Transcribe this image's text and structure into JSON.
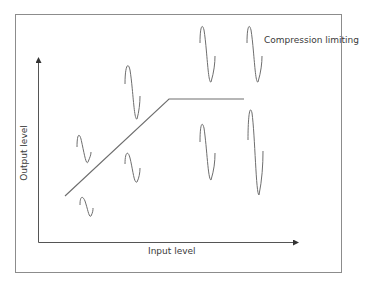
{
  "diagram": {
    "title_annotation": "Compression limiting",
    "x_axis_label": "Input level",
    "y_axis_label": "Output level",
    "colors": {
      "frame": "#8c8c8c",
      "axis": "#555555",
      "curve": "#6e6e6e",
      "wave": "#6e6e6e",
      "text": "#3a3a3a"
    },
    "transfer_curve": {
      "points": [
        [
          65,
          196
        ],
        [
          169,
          99
        ],
        [
          244,
          99
        ]
      ],
      "segments": [
        "linear region",
        "limited region"
      ]
    },
    "waveforms": [
      {
        "id": "input-small",
        "x": 88,
        "y_top": 196,
        "amplitude": "small"
      },
      {
        "id": "output-small",
        "x": 85,
        "y_top": 133,
        "amplitude": "small"
      },
      {
        "id": "input-medium",
        "x": 135,
        "y_top": 153,
        "amplitude": "medium"
      },
      {
        "id": "output-medium",
        "x": 131,
        "y_top": 62,
        "amplitude": "medium"
      },
      {
        "id": "input-large",
        "x": 207,
        "y_top": 120,
        "amplitude": "large"
      },
      {
        "id": "output-large",
        "x": 207,
        "y_top": 22,
        "amplitude": "limited"
      },
      {
        "id": "input-xlarge",
        "x": 254,
        "y_top": 104,
        "amplitude": "xlarge"
      },
      {
        "id": "output-xlarge",
        "x": 254,
        "y_top": 22,
        "amplitude": "limited"
      }
    ]
  }
}
